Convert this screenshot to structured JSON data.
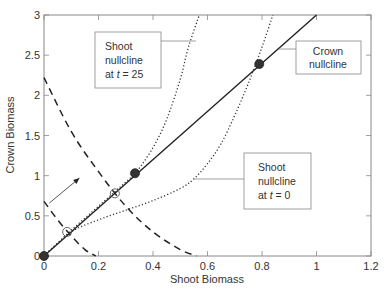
{
  "chart_data": {
    "type": "line",
    "title": "",
    "xlabel": "Shoot Biomass",
    "ylabel": "Crown Biomass",
    "xlim": [
      0,
      1.2
    ],
    "ylim": [
      0,
      3
    ],
    "xticks": [
      0,
      0.2,
      0.4,
      0.6,
      0.8,
      1,
      1.2
    ],
    "xtick_labels": [
      "0",
      "0.2",
      "0.4",
      "0.6",
      "0.8",
      "1",
      "1.2"
    ],
    "yticks": [
      0,
      0.5,
      1,
      1.5,
      2,
      2.5,
      3
    ],
    "ytick_labels": [
      "0",
      "0.5",
      "1",
      "1.5",
      "2",
      "2.5",
      "3"
    ],
    "grid": false,
    "legend": "none (callout boxes used)",
    "series": [
      {
        "name": "Crown nullcline",
        "style": "solid",
        "x": [
          0,
          1.0
        ],
        "y": [
          0,
          3.0
        ]
      },
      {
        "name": "Shoot nullcline at t = 0",
        "style": "dotted",
        "x": [
          0,
          0.1,
          0.2,
          0.3,
          0.4,
          0.5,
          0.55,
          0.6,
          0.65,
          0.7,
          0.75,
          0.8,
          0.84
        ],
        "y": [
          0,
          0.3,
          0.45,
          0.57,
          0.69,
          0.84,
          0.96,
          1.15,
          1.4,
          1.75,
          2.15,
          2.6,
          3.0
        ]
      },
      {
        "name": "Shoot nullcline at t = 25",
        "style": "dotted",
        "x": [
          0,
          0.1,
          0.2,
          0.26,
          0.3,
          0.34,
          0.4,
          0.45,
          0.5,
          0.53,
          0.57
        ],
        "y": [
          0,
          0.32,
          0.62,
          0.8,
          0.92,
          1.05,
          1.35,
          1.7,
          2.2,
          2.6,
          3.0
        ]
      },
      {
        "name": "Dashed isocline (upper)",
        "style": "dashed",
        "x": [
          0,
          0.1,
          0.2,
          0.3,
          0.4,
          0.5,
          0.56
        ],
        "y": [
          2.22,
          1.55,
          1.05,
          0.62,
          0.3,
          0.08,
          0
        ]
      },
      {
        "name": "Dashed isocline (lower)",
        "style": "dashed",
        "x": [
          0,
          0.05,
          0.1,
          0.15,
          0.19
        ],
        "y": [
          0.68,
          0.45,
          0.25,
          0.08,
          0
        ]
      }
    ],
    "points": [
      {
        "type": "filled",
        "x": 0,
        "y": 0
      },
      {
        "type": "filled",
        "x": 0.334,
        "y": 1.03
      },
      {
        "type": "filled",
        "x": 0.79,
        "y": 2.39
      },
      {
        "type": "open",
        "x": 0.085,
        "y": 0.3
      },
      {
        "type": "open",
        "x": 0.26,
        "y": 0.78
      }
    ],
    "arrow": {
      "from": [
        0.02,
        0.66
      ],
      "to": [
        0.13,
        0.97
      ]
    },
    "annotations": [
      {
        "text": [
          "Shoot",
          "nullcline",
          "at t = 25"
        ],
        "target": "Shoot nullcline at t = 25"
      },
      {
        "text": [
          "Crown",
          "nullcline"
        ],
        "target": "Crown nullcline"
      },
      {
        "text": [
          "Shoot",
          "nullcline",
          "at t = 0"
        ],
        "target": "Shoot nullcline at t = 0"
      }
    ]
  },
  "labels": {
    "xlabel": "Shoot Biomass",
    "ylabel": "Crown Biomass",
    "box_t25": {
      "line1": "Shoot",
      "line2": "nullcline",
      "line3_pre": "at ",
      "line3_t": "t",
      "line3_post": " = 25"
    },
    "box_crown": {
      "line1": "Crown",
      "line2": "nullcline"
    },
    "box_t0": {
      "line1": "Shoot",
      "line2": "nullcline",
      "line3_pre": "at ",
      "line3_t": "t",
      "line3_post": " = 0"
    }
  }
}
